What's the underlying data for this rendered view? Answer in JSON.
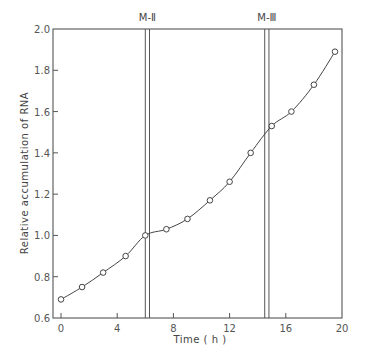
{
  "chart_data": {
    "type": "line",
    "title": "",
    "xlabel": "Time ( h )",
    "ylabel": "Relative accumulation of RNA",
    "xlim": [
      0,
      20
    ],
    "ylim": [
      0.6,
      2.0
    ],
    "x_ticks": [
      0,
      4,
      8,
      12,
      16,
      20
    ],
    "y_ticks": [
      0.6,
      0.8,
      1.0,
      1.2,
      1.4,
      1.6,
      1.8,
      2.0
    ],
    "x_tick_labels": [
      "0",
      "4",
      "8",
      "12",
      "16",
      "20"
    ],
    "y_tick_labels": [
      "0.6",
      "0.8",
      "1.0",
      "1.2",
      "1.4",
      "1.6",
      "1.8",
      "2.0"
    ],
    "grid": false,
    "legend": null,
    "series": [
      {
        "name": "RNA accumulation",
        "marker": "open-circle",
        "x": [
          0,
          1.5,
          3.0,
          4.6,
          6.0,
          7.5,
          9.0,
          10.6,
          12.0,
          13.5,
          15.0,
          16.4,
          18.0,
          19.5
        ],
        "y": [
          0.69,
          0.75,
          0.82,
          0.9,
          1.0,
          1.03,
          1.08,
          1.17,
          1.26,
          1.4,
          1.53,
          1.6,
          1.73,
          1.89
        ]
      }
    ],
    "annotations": [
      {
        "label": "M-Ⅱ",
        "type": "vertical-double-line",
        "x": [
          6.0,
          6.3
        ]
      },
      {
        "label": "M-Ⅲ",
        "type": "vertical-double-line",
        "x": [
          14.5,
          14.8
        ]
      }
    ]
  }
}
